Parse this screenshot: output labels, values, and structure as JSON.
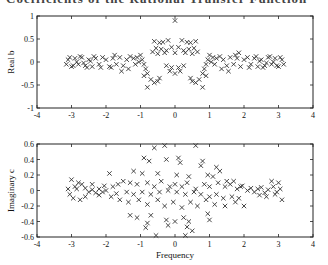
{
  "page": {
    "cropped_heading": "Coefficients of the Rational Transfer Function"
  },
  "chart_data": [
    {
      "type": "scatter",
      "title": "",
      "xlabel": "",
      "ylabel": "Real b",
      "xlim": [
        -4,
        4
      ],
      "ylim": [
        -1,
        1
      ],
      "xticks": [
        "-4",
        "-3",
        "-2",
        "-1",
        "0",
        "1",
        "2",
        "3",
        "4"
      ],
      "yticks": [
        "-1",
        "-0.5",
        "0",
        "0.5",
        "1"
      ],
      "grid": false,
      "marker": "x",
      "frame": {
        "left": 37,
        "top": 16,
        "right": 313,
        "bottom": 108
      },
      "points": [
        [
          0.0,
          0.9
        ],
        [
          -0.6,
          0.45
        ],
        [
          -0.45,
          0.42
        ],
        [
          -0.35,
          0.43
        ],
        [
          -0.2,
          0.47
        ],
        [
          0.2,
          0.47
        ],
        [
          0.35,
          0.43
        ],
        [
          0.45,
          0.42
        ],
        [
          0.6,
          0.45
        ],
        [
          -0.55,
          0.3
        ],
        [
          -0.4,
          0.28
        ],
        [
          -0.25,
          0.25
        ],
        [
          -0.1,
          0.32
        ],
        [
          0.0,
          0.2
        ],
        [
          0.1,
          0.32
        ],
        [
          0.25,
          0.25
        ],
        [
          0.4,
          0.28
        ],
        [
          0.55,
          0.3
        ],
        [
          -0.65,
          0.22
        ],
        [
          -0.5,
          0.18
        ],
        [
          -0.3,
          0.2
        ],
        [
          0.3,
          0.2
        ],
        [
          0.5,
          0.18
        ],
        [
          0.65,
          0.22
        ],
        [
          -0.25,
          -0.08
        ],
        [
          -0.15,
          -0.2
        ],
        [
          0.0,
          -0.25
        ],
        [
          0.15,
          -0.2
        ],
        [
          0.25,
          -0.08
        ],
        [
          -0.1,
          -0.12
        ],
        [
          0.1,
          -0.12
        ],
        [
          -0.7,
          -0.38
        ],
        [
          -0.6,
          -0.45
        ],
        [
          -0.5,
          -0.42
        ],
        [
          -0.8,
          -0.55
        ],
        [
          -0.45,
          -0.35
        ],
        [
          0.45,
          -0.35
        ],
        [
          0.5,
          -0.42
        ],
        [
          0.6,
          -0.45
        ],
        [
          0.7,
          -0.38
        ],
        [
          0.8,
          -0.55
        ],
        [
          -1.0,
          0.15
        ],
        [
          -0.95,
          0.05
        ],
        [
          -0.9,
          -0.05
        ],
        [
          -0.85,
          -0.15
        ],
        [
          -0.8,
          -0.25
        ],
        [
          -1.05,
          0.0
        ],
        [
          -1.1,
          0.1
        ],
        [
          -1.15,
          -0.05
        ],
        [
          -1.2,
          0.08
        ],
        [
          -0.9,
          -0.3
        ],
        [
          1.0,
          0.15
        ],
        [
          0.95,
          0.05
        ],
        [
          0.9,
          -0.05
        ],
        [
          0.85,
          -0.15
        ],
        [
          0.8,
          -0.25
        ],
        [
          1.05,
          0.0
        ],
        [
          1.1,
          0.1
        ],
        [
          1.15,
          -0.05
        ],
        [
          1.2,
          0.08
        ],
        [
          0.9,
          -0.3
        ],
        [
          -1.3,
          0.12
        ],
        [
          -1.4,
          0.05
        ],
        [
          -1.5,
          -0.08
        ],
        [
          -1.6,
          0.1
        ],
        [
          -1.7,
          -0.05
        ],
        [
          -1.8,
          0.08
        ],
        [
          -1.9,
          -0.1
        ],
        [
          -2.0,
          0.05
        ],
        [
          -1.35,
          -0.15
        ],
        [
          -1.55,
          -0.2
        ],
        [
          -1.75,
          0.15
        ],
        [
          -1.85,
          -0.12
        ],
        [
          -2.1,
          0.1
        ],
        [
          -2.2,
          -0.05
        ],
        [
          -2.3,
          0.08
        ],
        [
          -2.4,
          -0.1
        ],
        [
          -2.5,
          0.05
        ],
        [
          -2.6,
          -0.08
        ],
        [
          -2.7,
          0.1
        ],
        [
          -2.8,
          -0.05
        ],
        [
          -2.9,
          0.08
        ],
        [
          -3.0,
          -0.1
        ],
        [
          -3.1,
          0.05
        ],
        [
          -2.15,
          -0.12
        ],
        [
          -2.35,
          0.12
        ],
        [
          -2.55,
          -0.12
        ],
        [
          -2.75,
          0.12
        ],
        [
          -2.95,
          -0.08
        ],
        [
          -3.05,
          0.1
        ],
        [
          -2.45,
          0.02
        ],
        [
          -2.65,
          -0.02
        ],
        [
          -2.85,
          0.0
        ],
        [
          -3.15,
          -0.05
        ],
        [
          1.3,
          0.12
        ],
        [
          1.4,
          0.05
        ],
        [
          1.5,
          -0.08
        ],
        [
          1.6,
          0.1
        ],
        [
          1.7,
          -0.05
        ],
        [
          1.8,
          0.08
        ],
        [
          1.9,
          -0.1
        ],
        [
          2.0,
          0.05
        ],
        [
          1.35,
          -0.15
        ],
        [
          1.55,
          -0.2
        ],
        [
          1.75,
          0.15
        ],
        [
          1.85,
          0.2
        ],
        [
          2.1,
          0.1
        ],
        [
          2.2,
          -0.05
        ],
        [
          2.3,
          0.08
        ],
        [
          2.4,
          -0.1
        ],
        [
          2.5,
          0.05
        ],
        [
          2.6,
          -0.08
        ],
        [
          2.7,
          0.1
        ],
        [
          2.8,
          -0.05
        ],
        [
          2.9,
          0.08
        ],
        [
          3.0,
          -0.1
        ],
        [
          3.1,
          0.05
        ],
        [
          2.15,
          -0.12
        ],
        [
          2.35,
          0.12
        ],
        [
          2.55,
          -0.12
        ],
        [
          2.75,
          0.12
        ],
        [
          2.95,
          -0.08
        ],
        [
          3.05,
          0.1
        ],
        [
          2.45,
          0.02
        ],
        [
          2.65,
          -0.02
        ],
        [
          2.85,
          0.0
        ],
        [
          3.15,
          -0.05
        ]
      ]
    },
    {
      "type": "scatter",
      "title": "",
      "xlabel": "Frequency",
      "ylabel": "Imaginary c",
      "xlim": [
        -4,
        4
      ],
      "ylim": [
        -0.6,
        0.6
      ],
      "xticks": [
        "-4",
        "-3",
        "-2",
        "-1",
        "0",
        "1",
        "2",
        "3",
        "4"
      ],
      "yticks": [
        "-0.6",
        "-0.4",
        "-0.2",
        "0",
        "0.2",
        "0.4",
        "0.6"
      ],
      "grid": false,
      "marker": "x",
      "frame": {
        "left": 37,
        "top": 144,
        "right": 313,
        "bottom": 237
      },
      "points": [
        [
          -0.6,
          0.55
        ],
        [
          -0.3,
          0.58
        ],
        [
          0.6,
          0.58
        ],
        [
          -0.55,
          -0.58
        ],
        [
          0.3,
          -0.58
        ],
        [
          0.5,
          -0.52
        ],
        [
          -0.9,
          0.42
        ],
        [
          -0.75,
          0.38
        ],
        [
          -0.25,
          0.4
        ],
        [
          0.1,
          0.42
        ],
        [
          0.15,
          0.36
        ],
        [
          0.8,
          0.38
        ],
        [
          0.75,
          0.32
        ],
        [
          1.2,
          0.3
        ],
        [
          1.3,
          0.25
        ],
        [
          -1.2,
          0.25
        ],
        [
          -0.95,
          0.22
        ],
        [
          -0.5,
          0.22
        ],
        [
          0.05,
          0.2
        ],
        [
          0.4,
          0.18
        ],
        [
          0.95,
          0.2
        ],
        [
          1.1,
          0.18
        ],
        [
          1.5,
          0.12
        ],
        [
          -1.5,
          0.12
        ],
        [
          -1.3,
          0.1
        ],
        [
          -1.1,
          0.08
        ],
        [
          -0.8,
          0.1
        ],
        [
          -0.6,
          0.05
        ],
        [
          -0.4,
          0.12
        ],
        [
          -0.15,
          0.05
        ],
        [
          0.0,
          0.08
        ],
        [
          0.2,
          0.05
        ],
        [
          0.35,
          0.1
        ],
        [
          0.6,
          0.02
        ],
        [
          0.85,
          0.08
        ],
        [
          1.0,
          0.05
        ],
        [
          1.25,
          0.1
        ],
        [
          1.45,
          0.05
        ],
        [
          -1.4,
          -0.02
        ],
        [
          -1.2,
          -0.05
        ],
        [
          -0.95,
          -0.02
        ],
        [
          -0.7,
          -0.05
        ],
        [
          -0.45,
          -0.02
        ],
        [
          -0.2,
          0.0
        ],
        [
          0.05,
          -0.02
        ],
        [
          0.3,
          -0.05
        ],
        [
          0.55,
          -0.02
        ],
        [
          0.75,
          -0.05
        ],
        [
          1.0,
          -0.08
        ],
        [
          1.2,
          -0.05
        ],
        [
          1.4,
          -0.1
        ],
        [
          -1.6,
          -0.12
        ],
        [
          -1.35,
          -0.15
        ],
        [
          -1.05,
          -0.12
        ],
        [
          -0.8,
          -0.18
        ],
        [
          -0.5,
          -0.12
        ],
        [
          -0.3,
          -0.2
        ],
        [
          -0.05,
          -0.15
        ],
        [
          0.2,
          -0.22
        ],
        [
          0.45,
          -0.15
        ],
        [
          0.65,
          -0.2
        ],
        [
          0.9,
          -0.12
        ],
        [
          1.15,
          -0.18
        ],
        [
          1.45,
          -0.2
        ],
        [
          -1.3,
          -0.32
        ],
        [
          -1.1,
          -0.35
        ],
        [
          -0.7,
          -0.32
        ],
        [
          -0.25,
          -0.38
        ],
        [
          -0.2,
          -0.45
        ],
        [
          0.0,
          -0.4
        ],
        [
          0.25,
          -0.35
        ],
        [
          0.4,
          -0.4
        ],
        [
          0.95,
          -0.3
        ],
        [
          1.0,
          -0.38
        ],
        [
          -0.8,
          -0.42
        ],
        [
          -0.85,
          -0.48
        ],
        [
          0.35,
          -0.47
        ],
        [
          -1.8,
          0.05
        ],
        [
          -1.9,
          0.22
        ],
        [
          -2.0,
          0.0
        ],
        [
          -2.1,
          -0.02
        ],
        [
          -2.2,
          0.02
        ],
        [
          -2.3,
          -0.03
        ],
        [
          -2.4,
          0.01
        ],
        [
          -2.5,
          -0.02
        ],
        [
          -2.6,
          0.03
        ],
        [
          -2.7,
          0.08
        ],
        [
          -2.8,
          0.1
        ],
        [
          -2.9,
          0.05
        ],
        [
          -3.0,
          0.14
        ],
        [
          -3.05,
          -0.05
        ],
        [
          -2.95,
          -0.1
        ],
        [
          -2.75,
          -0.12
        ],
        [
          -2.6,
          -0.08
        ],
        [
          -2.4,
          0.08
        ],
        [
          -2.2,
          -0.06
        ],
        [
          -2.05,
          0.06
        ],
        [
          -1.7,
          -0.04
        ],
        [
          -1.65,
          0.08
        ],
        [
          -1.85,
          -0.08
        ],
        [
          -2.85,
          0.02
        ],
        [
          -3.1,
          0.02
        ],
        [
          1.6,
          0.08
        ],
        [
          1.7,
          0.12
        ],
        [
          1.8,
          0.02
        ],
        [
          1.85,
          -0.1
        ],
        [
          1.9,
          0.05
        ],
        [
          2.0,
          -0.2
        ],
        [
          2.1,
          0.0
        ],
        [
          2.2,
          0.03
        ],
        [
          2.3,
          -0.02
        ],
        [
          2.4,
          0.02
        ],
        [
          2.5,
          0.04
        ],
        [
          2.6,
          -0.03
        ],
        [
          2.7,
          0.01
        ],
        [
          2.8,
          0.12
        ],
        [
          2.9,
          -0.05
        ],
        [
          3.0,
          0.1
        ],
        [
          3.05,
          0.02
        ],
        [
          3.1,
          -0.12
        ],
        [
          2.45,
          -0.06
        ],
        [
          2.65,
          -0.08
        ],
        [
          2.85,
          0.05
        ],
        [
          1.75,
          -0.15
        ],
        [
          1.65,
          -0.08
        ],
        [
          2.95,
          -0.02
        ],
        [
          1.95,
          0.06
        ]
      ]
    }
  ]
}
